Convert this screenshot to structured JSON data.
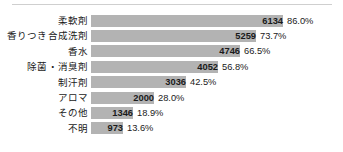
{
  "chart_data": {
    "type": "bar",
    "orientation": "horizontal",
    "title": "",
    "subtitle": "",
    "xlabel": "",
    "ylabel": "",
    "grid": false,
    "legend": null,
    "axis_visible": false,
    "xlim": [
      0,
      6134
    ],
    "value_label_position": "inside-right",
    "percent_label_position": "outside-right",
    "bar_color": "#b3b3b3",
    "text_color": "#1a1a1a",
    "divider_color": "#cfcfcf",
    "categories": [
      "柔軟剤",
      "香りつき合成洗剤",
      "香水",
      "除菌・消臭剤",
      "制汗剤",
      "アロマ",
      "その他",
      "不明"
    ],
    "values": [
      6134,
      5259,
      4746,
      4052,
      3036,
      2000,
      1346,
      973
    ],
    "percent_labels": [
      "86.0%",
      "73.7%",
      "66.5%",
      "56.8%",
      "42.5%",
      "28.0%",
      "18.9%",
      "13.6%"
    ],
    "percents": [
      86.0,
      73.7,
      66.5,
      56.8,
      42.5,
      28.0,
      18.9,
      13.6
    ],
    "rows": [
      {
        "label": "柔軟剤",
        "value": "6134",
        "percent": "86.0%",
        "bar_px": 192
      },
      {
        "label": "香りつき合成洗剤",
        "value": "5259",
        "percent": "73.7%",
        "bar_px": 165
      },
      {
        "label": "香水",
        "value": "4746",
        "percent": "66.5%",
        "bar_px": 149
      },
      {
        "label": "除菌・消臭剤",
        "value": "4052",
        "percent": "56.8%",
        "bar_px": 127
      },
      {
        "label": "制汗剤",
        "value": "3036",
        "percent": "42.5%",
        "bar_px": 95
      },
      {
        "label": "アロマ",
        "value": "2000",
        "percent": "28.0%",
        "bar_px": 63
      },
      {
        "label": "その他",
        "value": "1346",
        "percent": "18.9%",
        "bar_px": 42
      },
      {
        "label": "不明",
        "value": "973",
        "percent": "13.6%",
        "bar_px": 32
      }
    ]
  }
}
